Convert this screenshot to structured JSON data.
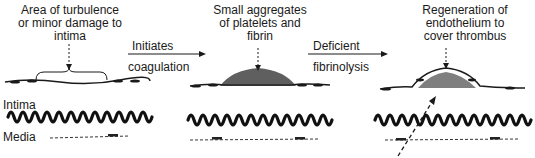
{
  "stages": [
    {
      "caption": [
        "Area of turbulence",
        "or minor damage to",
        "intima"
      ]
    },
    {
      "caption": [
        "Small aggregates",
        "of platelets and",
        "fibrin"
      ]
    },
    {
      "caption": [
        "Regeneration of",
        "endothelium to",
        "cover thrombus"
      ]
    }
  ],
  "transitions": [
    {
      "top": "Initiates",
      "bottom": "coagulation"
    },
    {
      "top": "Deficient",
      "bottom": "fibrinolysis"
    }
  ],
  "layers": {
    "intima": "Intima",
    "media": "Media"
  },
  "colors": {
    "ink": "#1a1a1a",
    "background": "#ffffff"
  }
}
